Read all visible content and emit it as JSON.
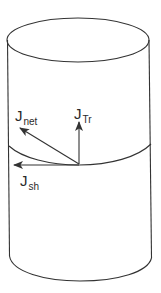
{
  "diagram": {
    "stroke_color": "#333333",
    "labels": {
      "j_net": {
        "main": "J",
        "sub": "net"
      },
      "j_tr": {
        "main": "J",
        "sub": "Tr"
      },
      "j_sh": {
        "main": "J",
        "sub": "sh"
      }
    },
    "vectors": [
      {
        "name": "J_net",
        "direction": "up-left diagonal"
      },
      {
        "name": "J_Tr",
        "direction": "vertical up"
      },
      {
        "name": "J_sh",
        "direction": "horizontal left"
      }
    ],
    "shape": "cylinder"
  }
}
